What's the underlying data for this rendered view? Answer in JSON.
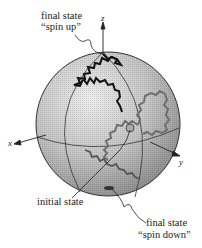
{
  "diagram": {
    "type": "bloch-sphere-random-walk",
    "axes": {
      "x": "x",
      "y": "y",
      "z": "z"
    },
    "labels": {
      "final_up_line1": "final state",
      "final_up_line2": "“spin up”",
      "initial": "initial state",
      "final_down_line1": "final state",
      "final_down_line2": "“spin down”"
    },
    "colors": {
      "sphere_light": "#e6e6e6",
      "sphere_dark": "#8c8c8c",
      "path_dark": "#111111",
      "path_gray": "#6e6e6e",
      "line": "#333333"
    }
  }
}
